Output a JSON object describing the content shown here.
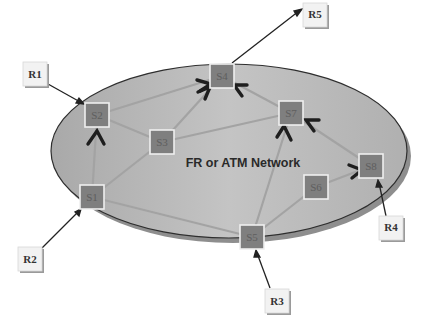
{
  "diagram": {
    "network_label": "FR or ATM Network",
    "colors": {
      "ellipse_fill": "#b9b9b9",
      "ellipse_stroke": "#2e2e2e",
      "ellipse_shadow": "#8e8e8e",
      "node_fill": "#7f7f7f",
      "node_border": "#efefef",
      "link": "#a3a3a3",
      "ext_box_fill": "#f2f2f2",
      "arrow": "#222222"
    },
    "switches": [
      {
        "id": "S1",
        "label": "S1",
        "x": 92,
        "y": 197
      },
      {
        "id": "S2",
        "label": "S2",
        "x": 97,
        "y": 115
      },
      {
        "id": "S3",
        "label": "S3",
        "x": 162,
        "y": 142
      },
      {
        "id": "S4",
        "label": "S4",
        "x": 222,
        "y": 76
      },
      {
        "id": "S5",
        "label": "S5",
        "x": 252,
        "y": 237
      },
      {
        "id": "S6",
        "label": "S6",
        "x": 316,
        "y": 187
      },
      {
        "id": "S7",
        "label": "S7",
        "x": 291,
        "y": 113
      },
      {
        "id": "S8",
        "label": "S8",
        "x": 371,
        "y": 166
      }
    ],
    "routers": [
      {
        "id": "R1",
        "label": "R1",
        "x": 34,
        "y": 100,
        "attaches_to": "S2"
      },
      {
        "id": "R2",
        "label": "R2",
        "x": 30,
        "y": 258,
        "attaches_to": "S1"
      },
      {
        "id": "R3",
        "label": "R3",
        "x": 275,
        "y": 299,
        "attaches_to": "S5"
      },
      {
        "id": "R4",
        "label": "R4",
        "x": 381,
        "y": 227,
        "attaches_to": "S8"
      },
      {
        "id": "R5",
        "label": "R5",
        "x": 312,
        "y": 27,
        "attaches_to": "S4"
      }
    ],
    "links": [
      [
        "S1",
        "S2"
      ],
      [
        "S1",
        "S3"
      ],
      [
        "S1",
        "S5"
      ],
      [
        "S2",
        "S4"
      ],
      [
        "S2",
        "S3"
      ],
      [
        "S3",
        "S4"
      ],
      [
        "S3",
        "S7"
      ],
      [
        "S5",
        "S7"
      ],
      [
        "S5",
        "S6"
      ],
      [
        "S6",
        "S8"
      ],
      [
        "S7",
        "S4"
      ],
      [
        "S8",
        "S7"
      ]
    ]
  }
}
